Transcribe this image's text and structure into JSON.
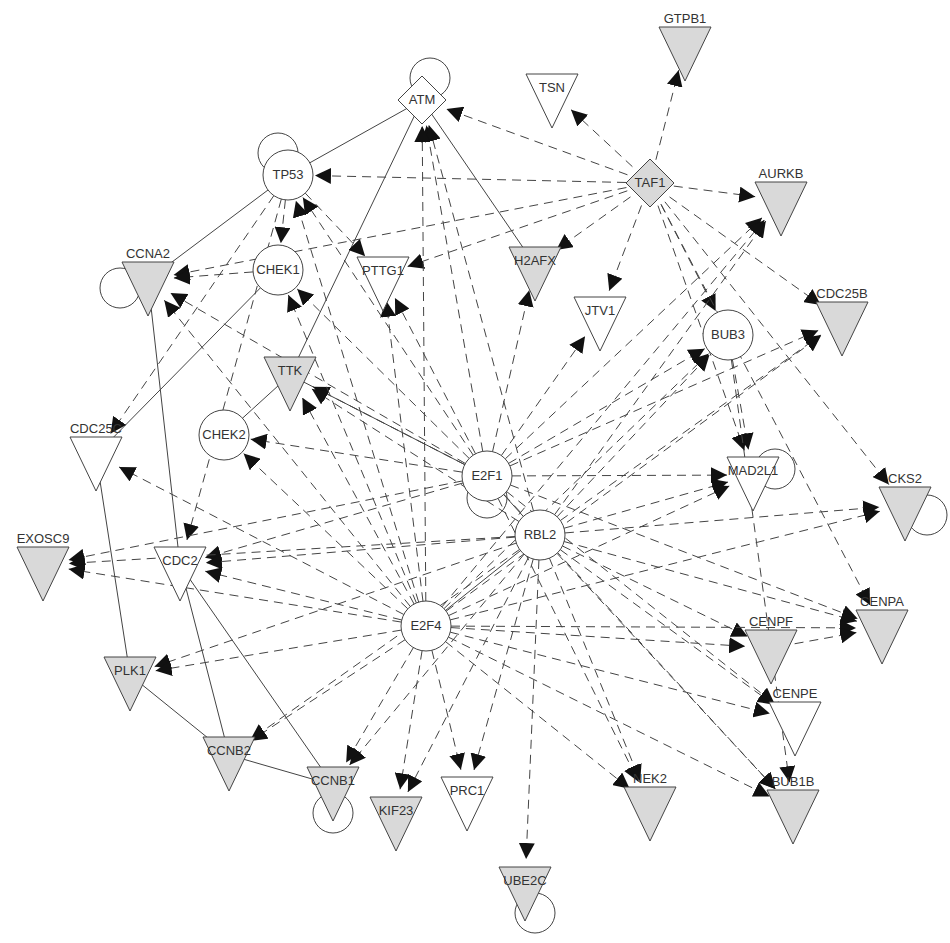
{
  "diagram": {
    "type": "gene-interaction-network",
    "colors": {
      "node_fill_gray": "#d9d9d9",
      "node_fill_white": "#ffffff",
      "stroke": "#444444",
      "arrow": "#111111"
    },
    "nodes": [
      {
        "id": "GTPB1",
        "label": "GTPB1",
        "shape": "triangle",
        "fill": "gray",
        "x": 685,
        "y": 45
      },
      {
        "id": "TSN",
        "label": "TSN",
        "shape": "triangle",
        "fill": "white",
        "x": 552,
        "y": 92
      },
      {
        "id": "ATM",
        "label": "ATM",
        "shape": "diamond",
        "fill": "white",
        "x": 422,
        "y": 100
      },
      {
        "id": "TAF1",
        "label": "TAF1",
        "shape": "diamond",
        "fill": "gray",
        "x": 650,
        "y": 183
      },
      {
        "id": "TP53",
        "label": "TP53",
        "shape": "circle",
        "fill": "white",
        "x": 288,
        "y": 175
      },
      {
        "id": "AURKB",
        "label": "AURKB",
        "shape": "triangle",
        "fill": "gray",
        "x": 781,
        "y": 200
      },
      {
        "id": "CCNA2",
        "label": "CCNA2",
        "shape": "triangle",
        "fill": "gray",
        "x": 148,
        "y": 280
      },
      {
        "id": "CHEK1",
        "label": "CHEK1",
        "shape": "circle",
        "fill": "white",
        "x": 278,
        "y": 270
      },
      {
        "id": "PTTG1",
        "label": "PTTG1",
        "shape": "triangle",
        "fill": "white",
        "x": 383,
        "y": 275
      },
      {
        "id": "H2AFX",
        "label": "H2AFX",
        "shape": "triangle",
        "fill": "gray",
        "x": 535,
        "y": 265
      },
      {
        "id": "JTV1",
        "label": "JTV1",
        "shape": "triangle",
        "fill": "white",
        "x": 600,
        "y": 315
      },
      {
        "id": "CDC25B",
        "label": "CDC25B",
        "shape": "triangle",
        "fill": "gray",
        "x": 842,
        "y": 320
      },
      {
        "id": "BUB3",
        "label": "BUB3",
        "shape": "circle",
        "fill": "white",
        "x": 728,
        "y": 335
      },
      {
        "id": "TTK",
        "label": "TTK",
        "shape": "triangle",
        "fill": "gray",
        "x": 290,
        "y": 375
      },
      {
        "id": "CDC25C",
        "label": "CDC25C",
        "shape": "triangle",
        "fill": "white",
        "x": 96,
        "y": 455
      },
      {
        "id": "CHEK2",
        "label": "CHEK2",
        "shape": "circle",
        "fill": "white",
        "x": 224,
        "y": 435
      },
      {
        "id": "E2F1",
        "label": "E2F1",
        "shape": "circle",
        "fill": "white",
        "x": 487,
        "y": 476
      },
      {
        "id": "MAD2L1",
        "label": "MAD2L1",
        "shape": "triangle",
        "fill": "white",
        "x": 753,
        "y": 475
      },
      {
        "id": "CKS2",
        "label": "CKS2",
        "shape": "triangle",
        "fill": "gray",
        "x": 905,
        "y": 505
      },
      {
        "id": "RBL2",
        "label": "RBL2",
        "shape": "circle",
        "fill": "white",
        "x": 540,
        "y": 535
      },
      {
        "id": "EXOSC9",
        "label": "EXOSC9",
        "shape": "triangle",
        "fill": "gray",
        "x": 43,
        "y": 565
      },
      {
        "id": "CDC2",
        "label": "CDC2",
        "shape": "triangle",
        "fill": "white",
        "x": 180,
        "y": 565
      },
      {
        "id": "E2F4",
        "label": "E2F4",
        "shape": "circle",
        "fill": "white",
        "x": 426,
        "y": 626
      },
      {
        "id": "CENPF",
        "label": "CENPF",
        "shape": "triangle",
        "fill": "gray",
        "x": 771,
        "y": 648
      },
      {
        "id": "CENPA",
        "label": "CENPA",
        "shape": "triangle",
        "fill": "gray",
        "x": 882,
        "y": 628
      },
      {
        "id": "PLK1",
        "label": "PLK1",
        "shape": "triangle",
        "fill": "gray",
        "x": 130,
        "y": 675
      },
      {
        "id": "CENPE",
        "label": "CENPE",
        "shape": "triangle",
        "fill": "white",
        "x": 795,
        "y": 720
      },
      {
        "id": "CCNB2",
        "label": "CCNB2",
        "shape": "triangle",
        "fill": "gray",
        "x": 229,
        "y": 755
      },
      {
        "id": "CCNB1",
        "label": "CCNB1",
        "shape": "triangle",
        "fill": "gray",
        "x": 333,
        "y": 785
      },
      {
        "id": "NEK2",
        "label": "NEK2",
        "shape": "triangle",
        "fill": "gray",
        "x": 650,
        "y": 805
      },
      {
        "id": "BUB1B",
        "label": "BUB1B",
        "shape": "triangle",
        "fill": "gray",
        "x": 793,
        "y": 808
      },
      {
        "id": "KIF23",
        "label": "KIF23",
        "shape": "triangle",
        "fill": "gray",
        "x": 396,
        "y": 815
      },
      {
        "id": "PRC1",
        "label": "PRC1",
        "shape": "triangle",
        "fill": "white",
        "x": 467,
        "y": 795
      },
      {
        "id": "UBE2C",
        "label": "UBE2C",
        "shape": "triangle",
        "fill": "gray",
        "x": 525,
        "y": 885
      }
    ],
    "self_loops": [
      "ATM",
      "TP53",
      "CCNA2",
      "E2F1",
      "MAD2L1",
      "CKS2",
      "CCNB1",
      "UBE2C"
    ],
    "solid_edges": [
      [
        "ATM",
        "TP53"
      ],
      [
        "ATM",
        "TTK"
      ],
      [
        "ATM",
        "H2AFX"
      ],
      [
        "TP53",
        "CCNA2"
      ],
      [
        "CHEK1",
        "CDC25C"
      ],
      [
        "CCNA2",
        "CDC2"
      ],
      [
        "CDC25C",
        "PLK1"
      ],
      [
        "TTK",
        "CHEK2"
      ],
      [
        "TTK",
        "E2F1"
      ],
      [
        "CDC2",
        "CCNB2"
      ],
      [
        "CDC2",
        "CCNB1"
      ],
      [
        "PLK1",
        "CCNB2"
      ],
      [
        "CCNB2",
        "CCNB1"
      ],
      [
        "E2F1",
        "RBL2"
      ],
      [
        "RBL2",
        "E2F4"
      ]
    ],
    "dashed_edges": [
      [
        "TAF1",
        "ATM"
      ],
      [
        "TAF1",
        "TP53"
      ],
      [
        "TAF1",
        "TSN"
      ],
      [
        "TAF1",
        "GTPB1"
      ],
      [
        "TAF1",
        "AURKB"
      ],
      [
        "TAF1",
        "CDC25B"
      ],
      [
        "TAF1",
        "H2AFX"
      ],
      [
        "TAF1",
        "JTV1"
      ],
      [
        "TAF1",
        "BUB3"
      ],
      [
        "TAF1",
        "PTTG1"
      ],
      [
        "TAF1",
        "CCNA2"
      ],
      [
        "TAF1",
        "MAD2L1"
      ],
      [
        "TAF1",
        "CKS2"
      ],
      [
        "TAF1",
        "CENPA"
      ],
      [
        "TP53",
        "CHEK1"
      ],
      [
        "TP53",
        "PTTG1"
      ],
      [
        "TP53",
        "CDC25C"
      ],
      [
        "TP53",
        "CDC2"
      ],
      [
        "CHEK1",
        "CCNA2"
      ],
      [
        "BUB3",
        "MAD2L1"
      ],
      [
        "BUB3",
        "BUB1B"
      ],
      [
        "E2F1",
        "ATM"
      ],
      [
        "E2F1",
        "TP53"
      ],
      [
        "E2F1",
        "CCNA2"
      ],
      [
        "E2F1",
        "TTK"
      ],
      [
        "E2F1",
        "CHEK2"
      ],
      [
        "E2F1",
        "PTTG1"
      ],
      [
        "E2F1",
        "H2AFX"
      ],
      [
        "E2F1",
        "JTV1"
      ],
      [
        "E2F1",
        "BUB3"
      ],
      [
        "E2F1",
        "AURKB"
      ],
      [
        "E2F1",
        "CDC25B"
      ],
      [
        "E2F1",
        "MAD2L1"
      ],
      [
        "E2F1",
        "CDC2"
      ],
      [
        "E2F1",
        "EXOSC9"
      ],
      [
        "E2F1",
        "CENPA"
      ],
      [
        "E2F1",
        "CENPE"
      ],
      [
        "E2F1",
        "NEK2"
      ],
      [
        "E2F1",
        "BUB1B"
      ],
      [
        "E2F1",
        "CHEK1"
      ],
      [
        "RBL2",
        "ATM"
      ],
      [
        "RBL2",
        "AURKB"
      ],
      [
        "RBL2",
        "BUB3"
      ],
      [
        "RBL2",
        "CDC25B"
      ],
      [
        "RBL2",
        "MAD2L1"
      ],
      [
        "RBL2",
        "CKS2"
      ],
      [
        "RBL2",
        "CENPA"
      ],
      [
        "RBL2",
        "CENPF"
      ],
      [
        "RBL2",
        "CDC2"
      ],
      [
        "RBL2",
        "EXOSC9"
      ],
      [
        "RBL2",
        "PLK1"
      ],
      [
        "RBL2",
        "CCNB2"
      ],
      [
        "RBL2",
        "CCNB1"
      ],
      [
        "RBL2",
        "KIF23"
      ],
      [
        "RBL2",
        "PRC1"
      ],
      [
        "RBL2",
        "UBE2C"
      ],
      [
        "RBL2",
        "NEK2"
      ],
      [
        "RBL2",
        "BUB1B"
      ],
      [
        "RBL2",
        "CENPE"
      ],
      [
        "RBL2",
        "TTK"
      ],
      [
        "E2F4",
        "ATM"
      ],
      [
        "E2F4",
        "TP53"
      ],
      [
        "E2F4",
        "CHEK1"
      ],
      [
        "E2F4",
        "PTTG1"
      ],
      [
        "E2F4",
        "TTK"
      ],
      [
        "E2F4",
        "CHEK2"
      ],
      [
        "E2F4",
        "CDC25C"
      ],
      [
        "E2F4",
        "CDC2"
      ],
      [
        "E2F4",
        "EXOSC9"
      ],
      [
        "E2F4",
        "PLK1"
      ],
      [
        "E2F4",
        "CCNB2"
      ],
      [
        "E2F4",
        "CCNB1"
      ],
      [
        "E2F4",
        "KIF23"
      ],
      [
        "E2F4",
        "PRC1"
      ],
      [
        "E2F4",
        "CENPF"
      ],
      [
        "E2F4",
        "CENPA"
      ],
      [
        "E2F4",
        "CKS2"
      ],
      [
        "E2F4",
        "BUB3"
      ],
      [
        "E2F4",
        "AURKB"
      ],
      [
        "E2F4",
        "MAD2L1"
      ],
      [
        "E2F4",
        "CDC25B"
      ],
      [
        "E2F4",
        "CENPE"
      ],
      [
        "E2F4",
        "NEK2"
      ],
      [
        "E2F4",
        "BUB1B"
      ],
      [
        "E2F4",
        "CCNA2"
      ],
      [
        "CENPF",
        "CENPA"
      ]
    ]
  }
}
